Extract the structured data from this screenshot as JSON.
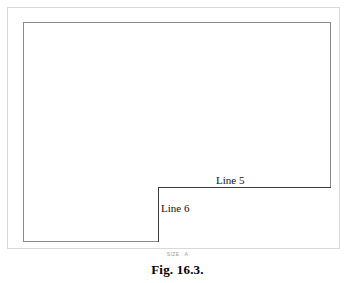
{
  "figure": {
    "caption": "Fig. 16.3.",
    "size_stamp": "SIZE : A",
    "sheet": {
      "outer_border_label": "sheet-trim-border",
      "inner_border_label": "drawing-frame-border",
      "border_color_outer": "#d8d8d8",
      "border_color_inner": "#8a8a8a",
      "background": "#ffffff"
    },
    "title_block": {
      "border_color": "#3a3a3a",
      "label": "title-block"
    },
    "callouts": [
      {
        "id": "line-5",
        "text": "Line 5"
      },
      {
        "id": "line-6",
        "text": "Line 6"
      }
    ]
  }
}
